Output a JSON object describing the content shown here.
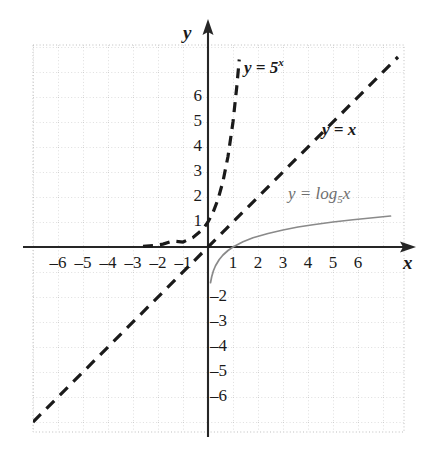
{
  "chart_data": {
    "type": "line",
    "title": "",
    "xlabel": "x",
    "ylabel": "y",
    "xlim": [
      -7,
      7.8
    ],
    "ylim": [
      -7.2,
      8
    ],
    "grid": true,
    "grid_step": 1,
    "legend": "inline-annotations",
    "xticks": [
      -6,
      -5,
      -4,
      -3,
      -2,
      -1,
      1,
      2,
      3,
      4,
      5,
      6
    ],
    "yticks": [
      6,
      5,
      4,
      3,
      2,
      1,
      -2,
      -3,
      -4,
      -5,
      -6
    ],
    "xtick_labels": [
      "–6",
      "–5",
      "–4",
      "–3",
      "–2",
      "–1",
      "1",
      "2",
      "3",
      "4",
      "5",
      "6"
    ],
    "ytick_labels": [
      "6",
      "5",
      "4",
      "3",
      "2",
      "1",
      "–2",
      "–3",
      "–4",
      "–5",
      "–6"
    ],
    "series": [
      {
        "name": "y = 5^x",
        "label": "y = 5",
        "label_exponent": "x",
        "style": "dashed",
        "color": "#1a1a1a",
        "width": 3.2,
        "x": [
          -2.6,
          -2.2,
          -1.8,
          -1.4,
          -1.0,
          -0.6,
          -0.2,
          0,
          0.2,
          0.4,
          0.6,
          0.8,
          1.0,
          1.15,
          1.25
        ],
        "y": [
          0.027,
          0.057,
          0.116,
          0.239,
          0.2,
          0.38,
          0.72,
          1.0,
          1.38,
          1.9,
          2.63,
          3.62,
          5.0,
          6.4,
          7.5
        ]
      },
      {
        "name": "y = x",
        "label": "y = x",
        "style": "dashed",
        "color": "#1a1a1a",
        "width": 3.2,
        "x": [
          -7.0,
          7.6
        ],
        "y": [
          -7.0,
          7.6
        ]
      },
      {
        "name": "y = log_5 x",
        "label": "y = log",
        "label_subscript": "5",
        "label_tail": "x",
        "style": "solid",
        "color": "#8a8a8a",
        "width": 1.6,
        "x": [
          0.1,
          0.15,
          0.22,
          0.3,
          0.45,
          0.6,
          0.8,
          1.0,
          1.4,
          1.8,
          2.4,
          3.0,
          3.6,
          4.2,
          5.0,
          5.8,
          6.6,
          7.3
        ],
        "y": [
          -1.43,
          -1.18,
          -0.94,
          -0.75,
          -0.5,
          -0.32,
          -0.14,
          0.0,
          0.21,
          0.37,
          0.54,
          0.68,
          0.8,
          0.89,
          1.0,
          1.09,
          1.17,
          1.24
        ]
      }
    ],
    "annotations": [
      {
        "text": "y = 5ˣ",
        "x": 1.45,
        "y": 6.25
      },
      {
        "text": "y = x",
        "x": 5.3,
        "y": 3.85
      },
      {
        "text": "y = log₅x",
        "x": 3.3,
        "y": 1.85
      }
    ]
  },
  "axes": {
    "x_axis_label": "x",
    "y_axis_label": "y"
  }
}
